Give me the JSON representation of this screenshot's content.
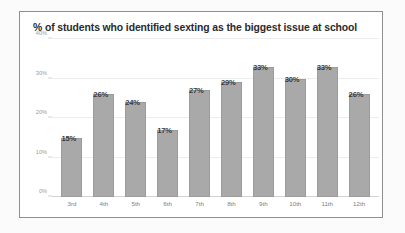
{
  "card": {
    "background": "#ffffff",
    "border_color": "#8f8f8f"
  },
  "chart_data": {
    "type": "bar",
    "title": "% of students who identified sexting as the biggest issue at school",
    "xlabel": "",
    "ylabel": "",
    "categories": [
      "3rd",
      "4th",
      "5th",
      "6th",
      "7th",
      "8th",
      "9th",
      "10th",
      "11th",
      "12th"
    ],
    "values": [
      15,
      26,
      24,
      17,
      27,
      29,
      33,
      30,
      33,
      26
    ],
    "data_labels": [
      "15%",
      "26%",
      "24%",
      "17%",
      "27%",
      "29%",
      "33%",
      "30%",
      "33%",
      "26%"
    ],
    "ylim": [
      0,
      40
    ],
    "yticks": [
      0,
      10,
      20,
      30,
      40
    ],
    "ytick_labels": [
      "0%",
      "10%",
      "20%",
      "30%",
      "40%"
    ],
    "grid": true,
    "legend": null,
    "bar_color": "#a9a9a9",
    "gridline_color": "#ececec",
    "axis_color": "#d2d2d2",
    "label_color": "#3a3a3a",
    "tick_color": "#9a9a9a"
  }
}
